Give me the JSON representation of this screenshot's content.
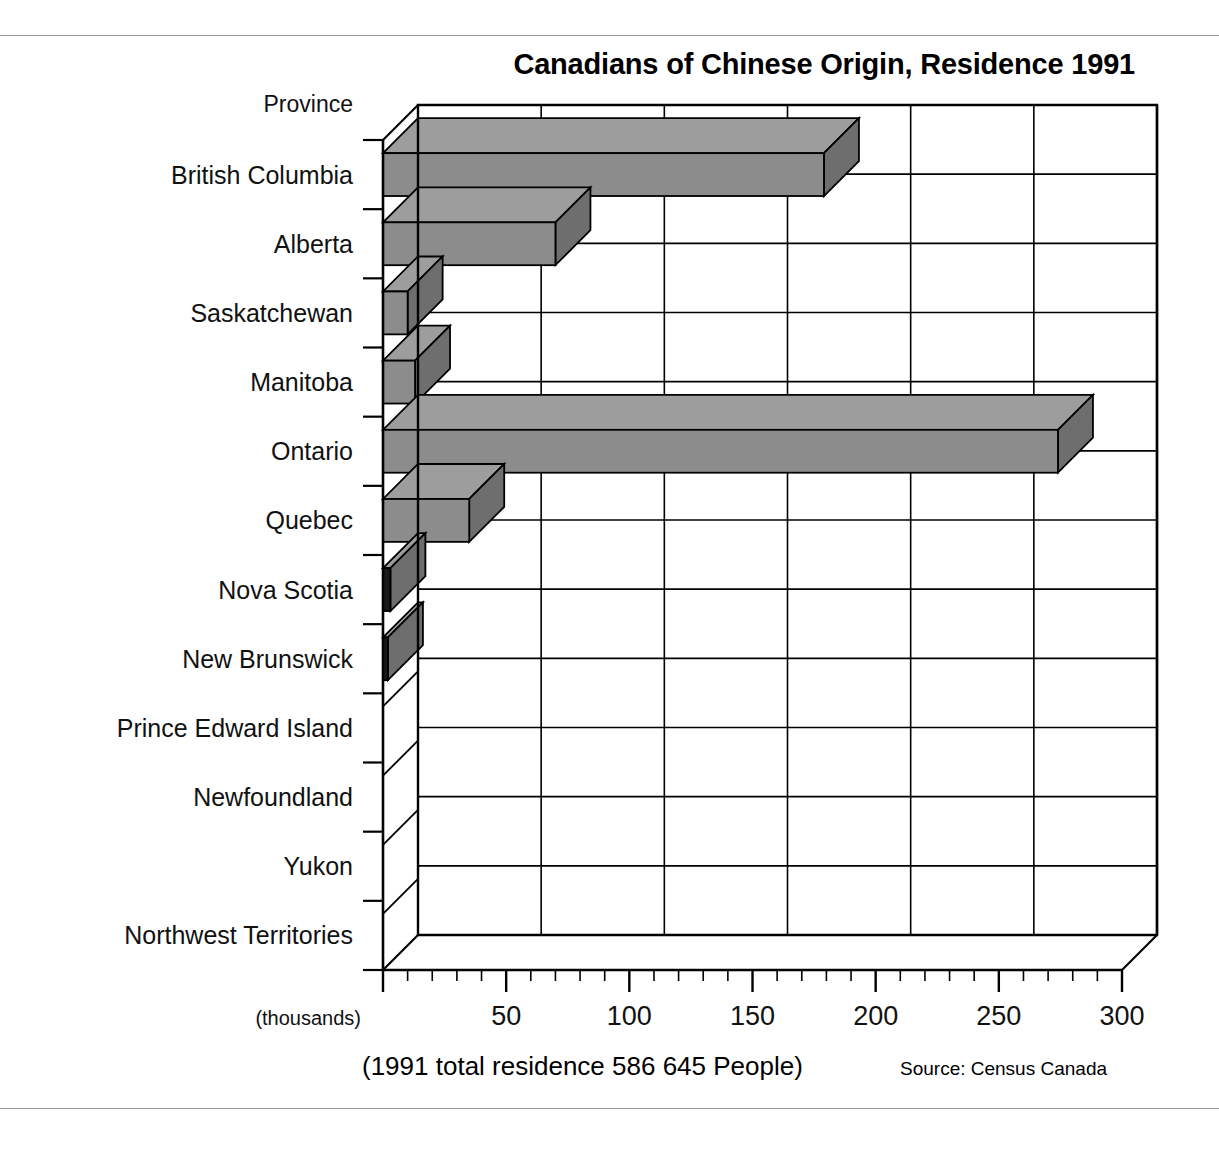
{
  "title": "Canadians of Chinese Origin, Residence 1991",
  "axis": {
    "category_header": "Province",
    "units_note": "(thousands)",
    "x_ticks": [
      50,
      100,
      150,
      200,
      250,
      300
    ],
    "x_tick_labels": [
      "50",
      "100",
      "150",
      "200",
      "250",
      "300"
    ]
  },
  "footer": {
    "total_note": "(1991 total residence 586 645 People)",
    "source": "Source: Census Canada"
  },
  "colors": {
    "bar_face": "#8c8c8c",
    "bar_top": "#9d9d9d",
    "bar_side": "#6e6e6e",
    "bar_dark_face": "#1a1a1a",
    "outline": "#000000",
    "grid": "#000000",
    "rule": "#9a9a9a",
    "background": "#ffffff"
  },
  "chart_data": {
    "type": "bar",
    "orientation": "horizontal",
    "title": "Canadians of Chinese Origin, Residence 1991",
    "xlabel": "(thousands)",
    "ylabel": "Province",
    "xlim": [
      0,
      300
    ],
    "grid": true,
    "legend": false,
    "annotations": [
      "(1991 total residence 586 645 People)",
      "Source: Census Canada"
    ],
    "categories": [
      "British Columbia",
      "Alberta",
      "Saskatchewan",
      "Manitoba",
      "Ontario",
      "Quebec",
      "Nova Scotia",
      "New Brunswick",
      "Prince Edward Island",
      "Newfoundland",
      "Yukon",
      "Northwest Territories"
    ],
    "values": [
      179,
      70,
      10,
      13,
      274,
      35,
      3,
      2,
      0,
      0,
      0,
      0
    ],
    "units": "thousands"
  }
}
